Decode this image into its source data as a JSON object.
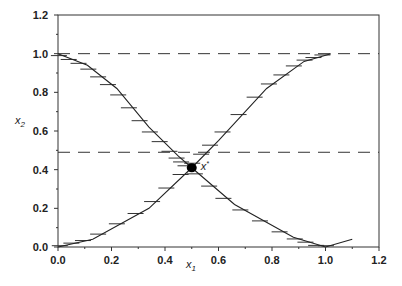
{
  "chart_data": {
    "type": "line",
    "title": "",
    "xlabel": "x1",
    "ylabel": "x2",
    "xlim": [
      0,
      1.2
    ],
    "ylim": [
      0,
      1.2
    ],
    "xticks": [
      "0.0",
      "0.2",
      "0.4",
      "0.6",
      "0.8",
      "1.0",
      "1.2"
    ],
    "yticks": [
      "0.0",
      "0.2",
      "0.4",
      "0.6",
      "0.8",
      "1.0",
      "1.2"
    ],
    "grid": false,
    "series": [
      {
        "name": "descending curve",
        "x": [
          0.0,
          0.11,
          0.22,
          0.34,
          0.45,
          0.5,
          0.66,
          0.88,
          1.0,
          1.1
        ],
        "y": [
          1.0,
          0.94,
          0.82,
          0.62,
          0.47,
          0.41,
          0.22,
          0.05,
          0.0,
          0.04
        ]
      },
      {
        "name": "ascending curve",
        "x": [
          0.0,
          0.13,
          0.34,
          0.5,
          0.6,
          0.78,
          0.92,
          1.02
        ],
        "y": [
          0.0,
          0.04,
          0.2,
          0.41,
          0.55,
          0.82,
          0.96,
          1.0
        ]
      }
    ],
    "reference_lines": [
      {
        "type": "horizontal",
        "y": 1.0,
        "style": "dashed"
      },
      {
        "type": "horizontal",
        "y": 0.49,
        "style": "dashed"
      }
    ],
    "annotations": [
      {
        "text": "x*",
        "x": 0.5,
        "y": 0.41,
        "marker": "filled-circle"
      }
    ]
  }
}
